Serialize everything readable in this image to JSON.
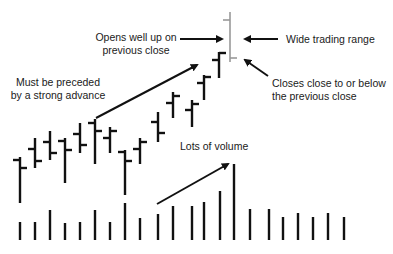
{
  "annotations": {
    "opens_up": [
      "Opens well up on",
      "previous close"
    ],
    "wide_range": "Wide trading range",
    "closes_close": [
      "Closes close to or below",
      "the previous close"
    ],
    "preceded": [
      "Must be preceded",
      "by a strong advance"
    ],
    "volume": "Lots of volume"
  },
  "colors": {
    "bar": "#111111",
    "highlight_bar": "#999999",
    "text": "#1a1a1a",
    "background": "#ffffff"
  },
  "chart_data": {
    "type": "ohlc_with_volume",
    "title": "",
    "xlabel": "",
    "ylabel": "",
    "grid": false,
    "note": "Pixel-space values (y grows downward). Price bars: x, high(top), low(bottom), open(left tick), close(right tick).",
    "price_bars": [
      {
        "x": 20,
        "high": 157,
        "low": 203,
        "open": 160,
        "close": 168
      },
      {
        "x": 35,
        "high": 138,
        "low": 168,
        "open": 149,
        "close": 161
      },
      {
        "x": 50,
        "high": 131,
        "low": 160,
        "open": 142,
        "close": 153
      },
      {
        "x": 65,
        "high": 138,
        "low": 183,
        "open": 141,
        "close": 150
      },
      {
        "x": 80,
        "high": 123,
        "low": 153,
        "open": 134,
        "close": 145
      },
      {
        "x": 95,
        "high": 119,
        "low": 164,
        "open": 123,
        "close": 131
      },
      {
        "x": 110,
        "high": 127,
        "low": 153,
        "open": 138,
        "close": 131
      },
      {
        "x": 125,
        "high": 150,
        "low": 195,
        "open": 152,
        "close": 161
      },
      {
        "x": 140,
        "high": 138,
        "low": 164,
        "open": 149,
        "close": 142
      },
      {
        "x": 158,
        "high": 112,
        "low": 142,
        "open": 122,
        "close": 133
      },
      {
        "x": 173,
        "high": 92,
        "low": 118,
        "open": 103,
        "close": 96
      },
      {
        "x": 158,
        "high": 0,
        "low": 0,
        "open": 0,
        "close": 0,
        "skip": true
      },
      {
        "x": 192,
        "high": 100,
        "low": 127,
        "open": 110,
        "close": 104
      },
      {
        "x": 204,
        "high": 75,
        "low": 100,
        "open": 83,
        "close": 77
      },
      {
        "x": 219,
        "high": 52,
        "low": 78,
        "open": 60,
        "close": 53
      },
      {
        "x": 230,
        "high": 12,
        "low": 62,
        "open": 20,
        "close": 58,
        "highlight": true
      }
    ],
    "volume_baseline": 240,
    "volume_bars": [
      {
        "x": 20,
        "top": 222
      },
      {
        "x": 35,
        "top": 222
      },
      {
        "x": 50,
        "top": 210
      },
      {
        "x": 65,
        "top": 223
      },
      {
        "x": 80,
        "top": 222
      },
      {
        "x": 95,
        "top": 210
      },
      {
        "x": 110,
        "top": 222
      },
      {
        "x": 125,
        "top": 203
      },
      {
        "x": 140,
        "top": 218
      },
      {
        "x": 158,
        "top": 214
      },
      {
        "x": 173,
        "top": 206
      },
      {
        "x": 192,
        "top": 206
      },
      {
        "x": 204,
        "top": 202
      },
      {
        "x": 220,
        "top": 191
      },
      {
        "x": 234,
        "top": 164
      },
      {
        "x": 250,
        "top": 209
      },
      {
        "x": 269,
        "top": 209
      },
      {
        "x": 283,
        "top": 217
      },
      {
        "x": 298,
        "top": 213
      },
      {
        "x": 313,
        "top": 217
      },
      {
        "x": 328,
        "top": 213
      },
      {
        "x": 344,
        "top": 217
      }
    ]
  }
}
